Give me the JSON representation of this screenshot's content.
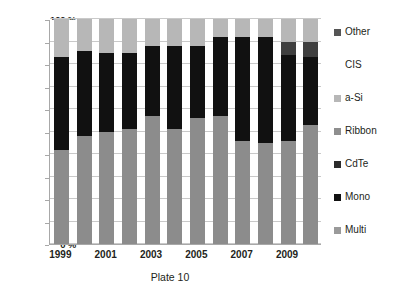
{
  "chart_data": {
    "type": "bar",
    "subtype": "stacked-percentage",
    "title": "Plate 10",
    "xlabel": "Plate 10",
    "ylabel": "",
    "ylim": [
      0,
      100
    ],
    "grid": true,
    "legend_position": "right",
    "categories": [
      "1999",
      "2000",
      "2001",
      "2002",
      "2003",
      "2004",
      "2005",
      "2006",
      "2007",
      "2008",
      "2009",
      "2010"
    ],
    "x_tick_labels": [
      "1999",
      "",
      "2001",
      "",
      "2003",
      "",
      "2005",
      "",
      "2007",
      "",
      "2009",
      ""
    ],
    "y_tick_labels": [
      "0 %",
      "10 %",
      "20 %",
      "30 %",
      "40 %",
      "50 %",
      "60 %",
      "70 %",
      "80 %",
      "90 %",
      "100 %"
    ],
    "y_tick_values": [
      0,
      10,
      20,
      30,
      40,
      50,
      60,
      70,
      80,
      90,
      100
    ],
    "series": [
      {
        "name": "Multi",
        "color": "#8c8c8c",
        "values": [
          42,
          48,
          50,
          51,
          57,
          51,
          56,
          57,
          46,
          45,
          46,
          53
        ]
      },
      {
        "name": "Mono",
        "color": "#111111",
        "values": [
          41,
          38,
          35,
          34,
          31,
          37,
          32,
          35,
          46,
          47,
          38,
          30
        ]
      },
      {
        "name": "CdTe",
        "color": "#3f3f3f",
        "values": [
          0,
          0,
          0,
          0,
          0,
          0,
          0,
          0,
          0,
          0,
          6,
          7
        ]
      },
      {
        "name": "Ribbon",
        "color": "#717171",
        "values": [
          0,
          0,
          0,
          0,
          0,
          0,
          0,
          0,
          0,
          0,
          0,
          0
        ]
      },
      {
        "name": "a-Si",
        "color": "#b7b7b7",
        "values": [
          17,
          14,
          15,
          15,
          12,
          12,
          12,
          8,
          8,
          8,
          10,
          10
        ]
      },
      {
        "name": "CIS",
        "color": "#ffffff",
        "values": [
          0,
          0,
          0,
          0,
          0,
          0,
          0,
          0,
          0,
          0,
          0,
          0
        ]
      },
      {
        "name": "Other",
        "color": "#555555",
        "values": [
          0,
          0,
          0,
          0,
          0,
          0,
          0,
          0,
          0,
          0,
          0,
          0
        ]
      }
    ],
    "legend_entries": [
      {
        "label": "Other",
        "color": "#555555",
        "has_swatch": true
      },
      {
        "label": "CIS",
        "color": "#ffffff",
        "has_swatch": false
      },
      {
        "label": "a-Si",
        "color": "#b7b7b7",
        "has_swatch": true
      },
      {
        "label": "Ribbon",
        "color": "#8e8e8e",
        "has_swatch": true
      },
      {
        "label": "CdTe",
        "color": "#2b2b2b",
        "has_swatch": true
      },
      {
        "label": "Mono",
        "color": "#111111",
        "has_swatch": true
      },
      {
        "label": "Multi",
        "color": "#9a9a9a",
        "has_swatch": true
      }
    ],
    "stack_order_bottom_to_top": [
      "Multi",
      "Mono",
      "CdTe",
      "Ribbon",
      "a-Si",
      "CIS",
      "Other"
    ]
  }
}
